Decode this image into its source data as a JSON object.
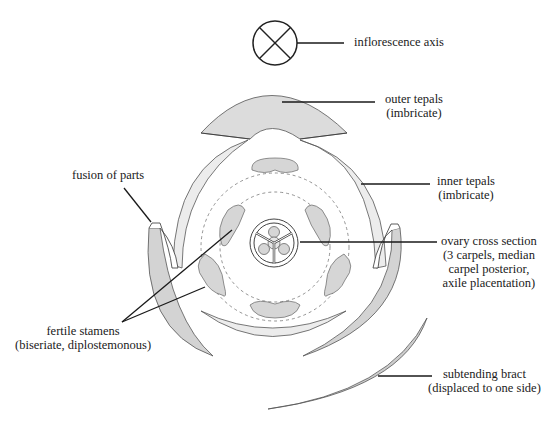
{
  "diagram": {
    "colors": {
      "outline": "#555555",
      "light_fill": "#e8e8e8",
      "medium_fill": "#d6d6d6",
      "dark_fill": "#c8c8c8",
      "leader_line": "#1a1a1a",
      "dashed": "#777777"
    },
    "labels": {
      "inflorescence_axis": {
        "line1": "inflorescence axis"
      },
      "outer_tepals": {
        "line1": "outer tepals",
        "line2": "(imbricate)"
      },
      "inner_tepals": {
        "line1": "inner tepals",
        "line2": "(imbricate)"
      },
      "fusion_of_parts": {
        "line1": "fusion of parts"
      },
      "ovary_cross_section": {
        "line1": "ovary cross section",
        "line2": "(3 carpels, median",
        "line3": "carpel posterior,",
        "line4": "axile placentation)"
      },
      "fertile_stamens": {
        "line1": "fertile stamens",
        "line2": "(biseriate, diplostemonous)"
      },
      "subtending_bract": {
        "line1": "subtending bract",
        "line2": "(displaced to one side)"
      }
    },
    "structures": [
      {
        "name": "inflorescence-axis",
        "symbol": "circle-with-x"
      },
      {
        "name": "outer-tepals",
        "count": 3
      },
      {
        "name": "inner-tepals",
        "count": 3
      },
      {
        "name": "stamens-outer-whorl",
        "count": 3
      },
      {
        "name": "stamens-inner-whorl",
        "count": 3
      },
      {
        "name": "ovary",
        "carpels": 3
      },
      {
        "name": "subtending-bract",
        "count": 1
      }
    ]
  }
}
